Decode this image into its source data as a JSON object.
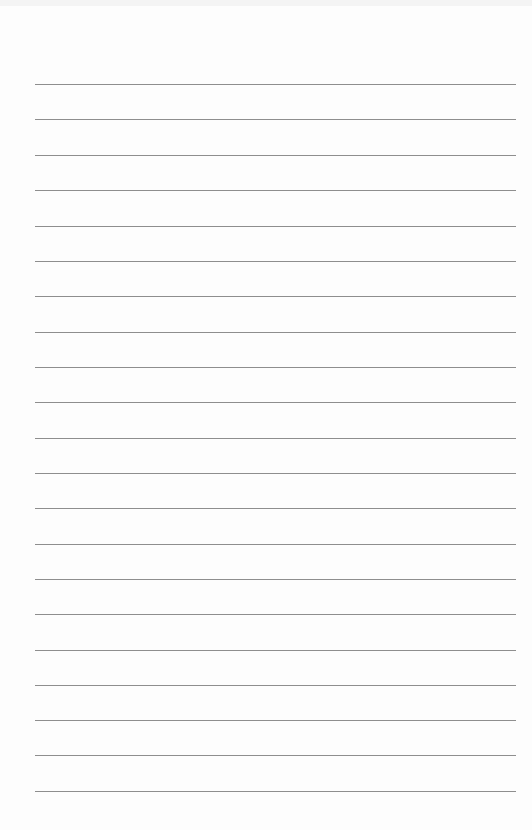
{
  "page": {
    "type": "lined-paper",
    "background_color": "#fdfdfd",
    "rule_color": "#7a7a7a",
    "rule_count": 21,
    "rule_left": 35,
    "rule_right": 516,
    "rule_positions_y": [
      84,
      119,
      155,
      190,
      226,
      261,
      296,
      332,
      367,
      402,
      438,
      473,
      508,
      544,
      579,
      614,
      650,
      685,
      720,
      755,
      791
    ]
  }
}
